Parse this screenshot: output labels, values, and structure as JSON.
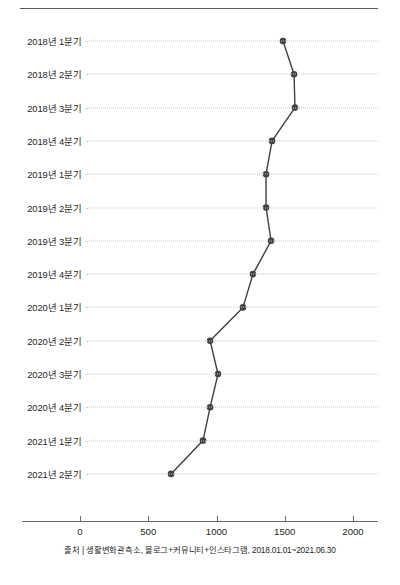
{
  "chart_data": {
    "type": "line",
    "orientation": "horizontal",
    "title": "",
    "subtitle": "",
    "xlabel": "",
    "ylabel": "",
    "xlim": [
      0,
      2100
    ],
    "grid": true,
    "grid_axis": "y",
    "legend": "none",
    "marker": "circle",
    "line_color": "#3f3f45",
    "marker_color": "#3f3f45",
    "grid_color": "#c9c9cf",
    "categories": [
      "2018년 1분기",
      "2018년 2분기",
      "2018년 3분기",
      "2018년 4분기",
      "2019년 1분기",
      "2019년 2분기",
      "2019년 3분기",
      "2019년 4분기",
      "2020년 1분기",
      "2020년 2분기",
      "2020년 3분기",
      "2020년 4분기",
      "2021년 1분기",
      "2021년 2분기"
    ],
    "values": [
      1487,
      1568,
      1575,
      1407,
      1363,
      1363,
      1400,
      1267,
      1194,
      953,
      1011,
      953,
      901,
      667
    ],
    "xticks": [
      0,
      500,
      1000,
      1500,
      2000
    ],
    "xtick_labels": [
      "0",
      "500",
      "1000",
      "1500",
      "2000"
    ],
    "annotations": []
  },
  "caption": {
    "source_text": "출처 | 생활변화관측소, 블로그+커뮤니티+인스타그램, 2018.01.01~2021.06.30"
  }
}
